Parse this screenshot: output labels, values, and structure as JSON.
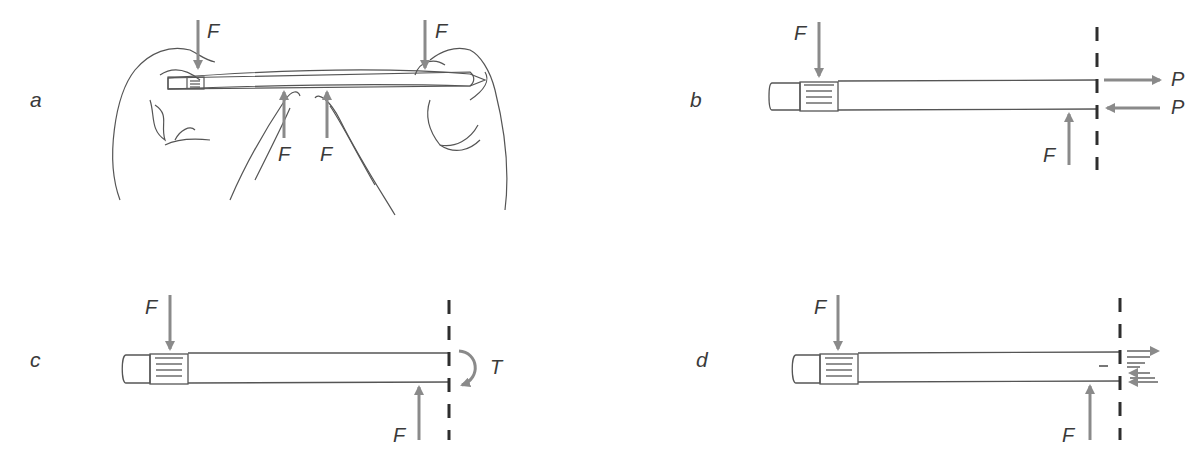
{
  "panels": {
    "a": {
      "label": "a",
      "force_labels": [
        "F",
        "F",
        "F",
        "F"
      ]
    },
    "b": {
      "label": "b",
      "force_labels": [
        "F",
        "F"
      ],
      "reaction_labels": [
        "P",
        "P"
      ]
    },
    "c": {
      "label": "c",
      "force_labels": [
        "F",
        "F"
      ],
      "torque_label": "T"
    },
    "d": {
      "label": "d",
      "force_labels": [
        "F",
        "F"
      ]
    }
  },
  "colors": {
    "arrow": "#8a8a8a",
    "outline": "#555555",
    "dashed": "#2e2e2e",
    "text": "#3a3a3a"
  }
}
